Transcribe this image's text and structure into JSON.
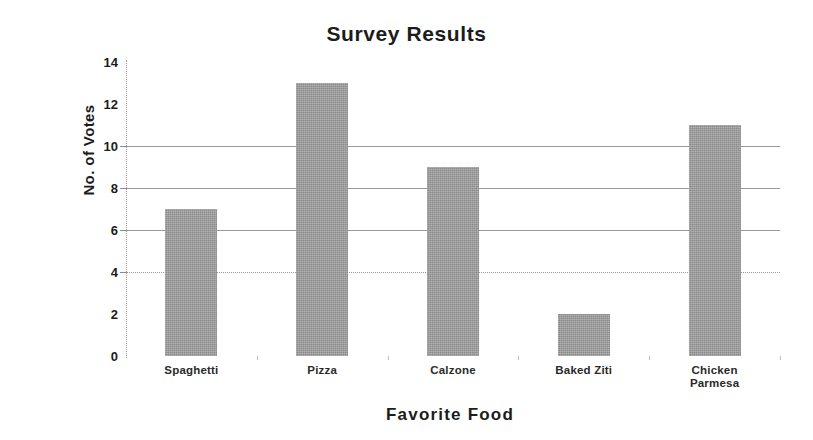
{
  "chart_data": {
    "type": "bar",
    "title": "Survey Results",
    "xlabel": "Favorite Food",
    "ylabel": "No. of Votes",
    "categories": [
      "Spaghetti",
      "Pizza",
      "Calzone",
      "Baked Ziti",
      "Chicken Parmesa"
    ],
    "values": [
      7,
      13,
      9,
      2,
      11
    ],
    "ylim": [
      0,
      14
    ],
    "ytick_labels": [
      "0",
      "2",
      "4",
      "6",
      "8",
      "10",
      "12",
      "14"
    ],
    "ytick_values": [
      0,
      2,
      4,
      6,
      8,
      10,
      12,
      14
    ],
    "gridlines_at": [
      4,
      6,
      8,
      10
    ],
    "grid": true,
    "legend": false,
    "bar_color": "#8a8a8a",
    "grid_color": "#9a9a9a",
    "text_color": "#1c1c1c",
    "background": "#ffffff"
  }
}
